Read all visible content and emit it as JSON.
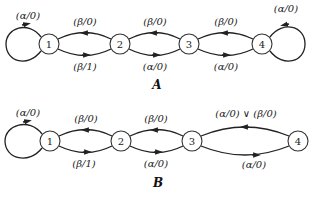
{
  "diagrams": [
    {
      "caption": "A",
      "nodes": [
        {
          "id": "1",
          "x": 49,
          "y": 44
        },
        {
          "id": "2",
          "x": 120,
          "y": 44
        },
        {
          "id": "3",
          "x": 189,
          "y": 44
        },
        {
          "id": "4",
          "x": 262,
          "y": 44
        }
      ],
      "edges": [
        {
          "from": "1",
          "to": "1",
          "label": "(α/0)",
          "type": "self-loop-left"
        },
        {
          "from": "2",
          "to": "1",
          "label": "(β/0)",
          "type": "upper"
        },
        {
          "from": "1",
          "to": "2",
          "label": "(β/1)",
          "type": "lower"
        },
        {
          "from": "3",
          "to": "2",
          "label": "(β/0)",
          "type": "upper"
        },
        {
          "from": "2",
          "to": "3",
          "label": "(α/0)",
          "type": "lower"
        },
        {
          "from": "4",
          "to": "3",
          "label": "(β/0)",
          "type": "upper"
        },
        {
          "from": "3",
          "to": "4",
          "label": "(α/0)",
          "type": "lower"
        },
        {
          "from": "4",
          "to": "4",
          "label": "(α/0)",
          "type": "self-loop-right"
        }
      ]
    },
    {
      "caption": "B",
      "nodes": [
        {
          "id": "1",
          "x": 50,
          "y": 141
        },
        {
          "id": "2",
          "x": 121,
          "y": 141
        },
        {
          "id": "3",
          "x": 192,
          "y": 141
        },
        {
          "id": "4",
          "x": 298,
          "y": 141
        }
      ],
      "edges": [
        {
          "from": "1",
          "to": "1",
          "label": "(α/0)",
          "type": "self-loop-left"
        },
        {
          "from": "2",
          "to": "1",
          "label": "(β/0)",
          "type": "upper"
        },
        {
          "from": "1",
          "to": "2",
          "label": "(β/1)",
          "type": "lower"
        },
        {
          "from": "3",
          "to": "2",
          "label": "(β/0)",
          "type": "upper"
        },
        {
          "from": "2",
          "to": "3",
          "label": "(α/0)",
          "type": "lower"
        },
        {
          "from": "4",
          "to": "3",
          "label": "(α/0) ∨ (β/0)",
          "type": "upper"
        },
        {
          "from": "3",
          "to": "4",
          "label": "(α/0)",
          "type": "lower"
        }
      ]
    }
  ]
}
